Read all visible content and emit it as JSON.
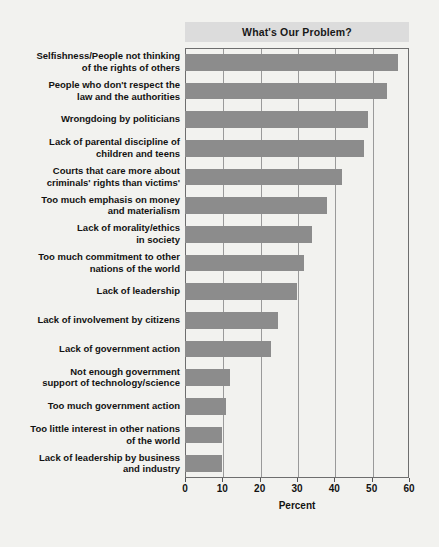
{
  "chart_data": {
    "type": "bar",
    "orientation": "horizontal",
    "title": "What's Our Problem?",
    "xlabel": "Percent",
    "ylabel": "",
    "xlim": [
      0,
      60
    ],
    "xticks": [
      0,
      10,
      20,
      30,
      40,
      50,
      60
    ],
    "grid": true,
    "legend": null,
    "bar_color": "#8c8c8c",
    "categories": [
      "Selfishness/People not thinking\nof the rights of others",
      "People who don't respect the\nlaw and the authorities",
      "Wrongdoing by politicians",
      "Lack of parental discipline of\nchildren and teens",
      "Courts that care more about\ncriminals' rights than victims'",
      "Too much emphasis on money\nand materialism",
      "Lack of morality/ethics\nin society",
      "Too much commitment to other\nnations of the world",
      "Lack of leadership",
      "Lack of involvement by citizens",
      "Lack of government action",
      "Not enough government\nsupport of technology/science",
      "Too much government action",
      "Too little interest in other nations\nof the world",
      "Lack of leadership by business\nand industry"
    ],
    "values": [
      57,
      54,
      49,
      48,
      42,
      38,
      34,
      32,
      30,
      25,
      23,
      12,
      11,
      10,
      10
    ]
  },
  "colors": {
    "background": "#f2f2ef",
    "title_band": "#dcdcdc",
    "bar": "#8c8c8c",
    "gridline": "#9a9a9a",
    "frame": "#6e6e6e",
    "text": "#121212"
  }
}
